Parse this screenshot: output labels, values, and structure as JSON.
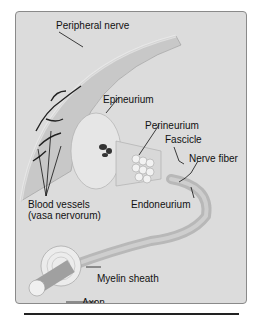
{
  "diagram": {
    "labels": {
      "peripheral_nerve": "Peripheral nerve",
      "epineurium": "Epineurium",
      "perineurium": "Perineurium",
      "fascicle": "Fascicle",
      "nerve_fiber": "Nerve fiber",
      "blood_vessels_1": "Blood vessels",
      "blood_vessels_2": "(vasa nervorum)",
      "endoneurium": "Endoneurium",
      "myelin_sheath": "Myelin sheath",
      "axon": "Axon"
    },
    "colors": {
      "panel_bg": "#dcdcdc",
      "border": "#8a8a8a",
      "vessel": "#222222"
    }
  }
}
